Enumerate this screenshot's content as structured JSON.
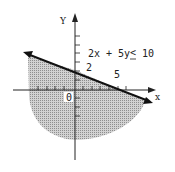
{
  "diagram": {
    "inequality": "2x + 5y ≤ 10",
    "inequality_lhs": "2x + 5y",
    "inequality_op": "<",
    "inequality_rhs": "10",
    "axes": {
      "x_label": "x",
      "y_label": "Y",
      "origin_label": "0"
    },
    "intercepts": {
      "y_intercept_label": "2",
      "x_intercept_label": "5"
    },
    "boundary_line": "2x + 5y = 10",
    "shaded_region": "below boundary line (solution set)",
    "colors": {
      "line": "#111111",
      "shade": "#b5b5b5",
      "background": "#ffffff"
    }
  }
}
